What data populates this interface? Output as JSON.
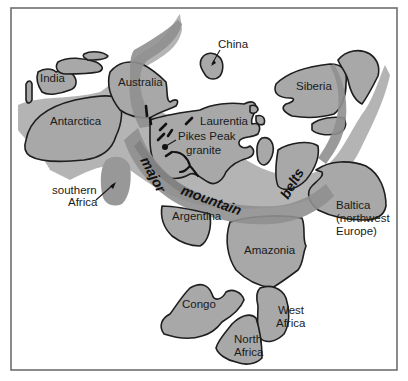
{
  "figure": {
    "type": "paleogeographic map",
    "frame_color": "#6e6e6e",
    "colors": {
      "craton_fill": "#a8a8a8",
      "craton_outline": "#1e1e1e",
      "shelf_fill": "#b4b4b4",
      "mountain_belt_fill": "#8f8f8f",
      "background": "#ffffff"
    }
  },
  "labels": {
    "india": "India",
    "australia": "Australia",
    "china": "China",
    "siberia": "Siberia",
    "antarctica": "Antarctica",
    "laurentia": "Laurentia",
    "pikes_peak_line1": "Pikes Peak",
    "pikes_peak_line2": "granite",
    "southern_africa_line1": "southern",
    "southern_africa_line2": "Africa",
    "argentina": "Argentina",
    "amazonia": "Amazonia",
    "baltica_line1": "Baltica",
    "baltica_line2": "(northwest",
    "baltica_line3": "Europe)",
    "congo": "Congo",
    "west_africa_line1": "West",
    "west_africa_line2": "Africa",
    "north_africa_line1": "North",
    "north_africa_line2": "Africa"
  },
  "belt_labels": {
    "word1": "major",
    "word2": "mountain",
    "word3": "belts"
  }
}
